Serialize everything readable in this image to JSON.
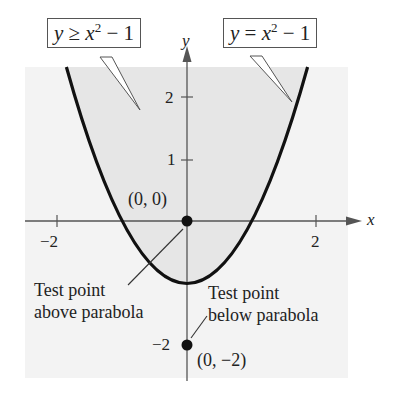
{
  "diagram": {
    "type": "graph-of-inequality",
    "inequality": {
      "var_left": "y",
      "relation": "≥",
      "var_right": "x",
      "exponent": "2",
      "tail": " − 1"
    },
    "boundary": {
      "var_left": "y",
      "relation": "=",
      "var_right": "x",
      "exponent": "2",
      "tail": " − 1"
    },
    "axes": {
      "x_label": "x",
      "y_label": "y",
      "x_ticks": [
        {
          "value": -2,
          "label": "−2"
        },
        {
          "value": 2,
          "label": "2"
        }
      ],
      "y_ticks": [
        {
          "value": 2,
          "label": "2"
        },
        {
          "value": 1,
          "label": "1"
        },
        {
          "value": -2,
          "label": "−2"
        }
      ]
    },
    "points": [
      {
        "x": 0,
        "y": 0,
        "label": "(0, 0)"
      },
      {
        "x": 0,
        "y": -2,
        "label": "(0, −2)"
      }
    ],
    "annotations": {
      "above": {
        "line1": "Test point",
        "line2": "above parabola"
      },
      "below": {
        "line1": "Test point",
        "line2": "below parabola"
      }
    },
    "colors": {
      "panel": "#f3f3f3",
      "shaded_region": "#e6e6e6",
      "curve": "#111111",
      "axis": "#555555",
      "text": "#222222"
    }
  }
}
